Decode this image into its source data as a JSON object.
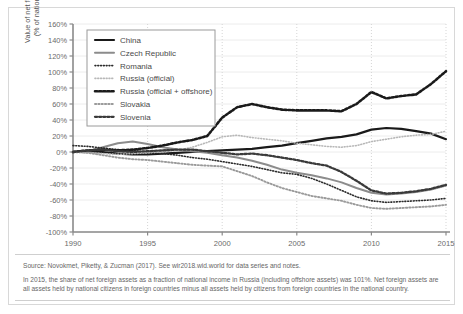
{
  "figure": {
    "axis_title_line1": "Value of net foreign assets",
    "axis_title_line2": "(% of national income)",
    "source": "Source: Novokmet, Piketty, & Zucman (2017). See wir2018.wid.world for data series and notes.",
    "note": "In 2015, the share of net foreign assets as a fraction of national income in Russia (including offshore assets) was 101%. Net foreign assets are all assets held by national citizens in foreign countries minus all assets held by citizens from foreign countries in the national country."
  },
  "chart_data": {
    "type": "line",
    "title": "",
    "xlabel": "",
    "ylabel": "Value of net foreign assets (% of national income)",
    "xlim": [
      1990,
      2015
    ],
    "ylim": [
      -100,
      160
    ],
    "ytick_labels": [
      "160%",
      "140%",
      "120%",
      "100%",
      "80%",
      "60%",
      "40%",
      "20%",
      "0%",
      "-20%",
      "-40%",
      "-60%",
      "-80%",
      "-100%"
    ],
    "ytick_values": [
      160,
      140,
      120,
      100,
      80,
      60,
      40,
      20,
      0,
      -20,
      -40,
      -60,
      -80,
      -100
    ],
    "xtick_labels": [
      "1990",
      "1995",
      "2000",
      "2005",
      "2010",
      "2015"
    ],
    "xtick_values": [
      1990,
      1995,
      2000,
      2005,
      2010,
      2015
    ],
    "grid": true,
    "legend_position": "upper-left",
    "x": [
      1990,
      1991,
      1992,
      1993,
      1994,
      1995,
      1996,
      1997,
      1998,
      1999,
      2000,
      2001,
      2002,
      2003,
      2004,
      2005,
      2006,
      2007,
      2008,
      2009,
      2010,
      2011,
      2012,
      2013,
      2014,
      2015
    ],
    "series": [
      {
        "name": "China",
        "color": "#1a1a1a",
        "style": "solid",
        "width": 2.2,
        "values": [
          0,
          1,
          0,
          -2,
          -3,
          -3,
          -2,
          -1,
          0,
          1,
          2,
          3,
          4,
          6,
          8,
          11,
          14,
          17,
          19,
          22,
          28,
          30,
          29,
          26,
          23,
          16
        ]
      },
      {
        "name": "Czech Republic",
        "color": "#8c8c8c",
        "style": "solid",
        "width": 2.0,
        "values": [
          0,
          1,
          6,
          11,
          13,
          10,
          6,
          3,
          1,
          -1,
          -4,
          -7,
          -11,
          -16,
          -22,
          -26,
          -29,
          -33,
          -38,
          -45,
          -51,
          -53,
          -52,
          -50,
          -47,
          -42
        ]
      },
      {
        "name": "Romania",
        "color": "#2b2b2b",
        "style": "dotted-fine",
        "width": 1.6,
        "values": [
          8,
          7,
          5,
          3,
          2,
          0,
          -2,
          -4,
          -7,
          -9,
          -12,
          -15,
          -18,
          -22,
          -26,
          -28,
          -33,
          -40,
          -48,
          -56,
          -61,
          -63,
          -62,
          -61,
          -60,
          -58
        ]
      },
      {
        "name": "Russia (official)",
        "color": "#b8b8b8",
        "style": "dotted-fine",
        "width": 1.6,
        "values": [
          0,
          -1,
          -2,
          -3,
          -2,
          -1,
          0,
          2,
          6,
          12,
          19,
          21,
          18,
          16,
          14,
          11,
          9,
          7,
          6,
          8,
          13,
          16,
          19,
          21,
          22,
          26
        ]
      },
      {
        "name": "Russia (official + offshore)",
        "color": "#1a1a1a",
        "style": "dotted-bold",
        "width": 2.6,
        "values": [
          0,
          2,
          3,
          2,
          3,
          5,
          8,
          12,
          15,
          20,
          43,
          56,
          60,
          56,
          53,
          52,
          52,
          52,
          51,
          60,
          75,
          67,
          70,
          72,
          85,
          101
        ]
      },
      {
        "name": "Slovakia",
        "color": "#9a9a9a",
        "style": "dotted-med",
        "width": 1.9,
        "values": [
          0,
          -1,
          -4,
          -7,
          -9,
          -10,
          -12,
          -14,
          -16,
          -17,
          -18,
          -24,
          -30,
          -38,
          -45,
          -50,
          -55,
          -58,
          -61,
          -66,
          -70,
          -71,
          -70,
          -69,
          -68,
          -66
        ]
      },
      {
        "name": "Slovenia",
        "color": "#3a3a3a",
        "style": "dotted-bold",
        "width": 2.3,
        "values": [
          0,
          2,
          3,
          1,
          0,
          1,
          2,
          3,
          3,
          1,
          -1,
          -3,
          -2,
          -4,
          -7,
          -10,
          -14,
          -17,
          -25,
          -36,
          -48,
          -52,
          -51,
          -49,
          -46,
          -41
        ]
      }
    ]
  },
  "legend": {
    "entries": [
      {
        "label": "China"
      },
      {
        "label": "Czech Republic"
      },
      {
        "label": "Romania"
      },
      {
        "label": "Russia (official)"
      },
      {
        "label": "Russia (official + offshore)"
      },
      {
        "label": "Slovakia"
      },
      {
        "label": "Slovenia"
      }
    ]
  }
}
